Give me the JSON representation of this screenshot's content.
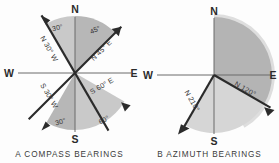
{
  "figures": [
    {
      "id": "compass-bearings",
      "caption": "A   COMPASS BEARINGS",
      "caption_letter": "A",
      "caption_text": "COMPASS BEARINGS",
      "cardinals": {
        "north": "N",
        "south": "S",
        "east": "E",
        "west": "W"
      },
      "center": {
        "x": 75,
        "y": 73
      },
      "radius": 57,
      "bearings": [
        {
          "name": "n30w",
          "label": "N 30° W",
          "angle_label": "30°",
          "quadrant": "NW",
          "from": "N",
          "degrees": 30,
          "toward": "W",
          "azimuth": 330
        },
        {
          "name": "n45e",
          "label": "N 45° E",
          "angle_label": "45°",
          "quadrant": "NE",
          "from": "N",
          "degrees": 45,
          "toward": "E",
          "azimuth": 45
        },
        {
          "name": "s60e",
          "label": "S 60° E",
          "angle_label": "60°",
          "quadrant": "SE",
          "from": "S",
          "degrees": 60,
          "toward": "E",
          "azimuth": 120
        },
        {
          "name": "s30w",
          "label": "S 30° W",
          "angle_label": "30°",
          "quadrant": "SW",
          "from": "S",
          "degrees": 30,
          "toward": "W",
          "azimuth": 210
        }
      ],
      "shaded_sectors": [
        {
          "name": "nw-sector",
          "from_azimuth": 330,
          "to_azimuth": 360,
          "tone": "#c9c9c9"
        },
        {
          "name": "ne-sector",
          "from_azimuth": 0,
          "to_azimuth": 45,
          "tone": "#b9b9b9"
        },
        {
          "name": "se-sector",
          "from_azimuth": 120,
          "to_azimuth": 180,
          "tone": "#c9c9c9"
        },
        {
          "name": "sw-sector",
          "from_azimuth": 180,
          "to_azimuth": 210,
          "tone": "#b9b9b9"
        }
      ]
    },
    {
      "id": "azimuth-bearings",
      "caption": "B   AZIMUTH BEARINGS",
      "caption_letter": "B",
      "caption_text": "AZIMUTH BEARINGS",
      "cardinals": {
        "north": "N",
        "south": "S",
        "east": "E",
        "west": "W"
      },
      "center": {
        "x": 74,
        "y": 75
      },
      "radius": 58,
      "bearings": [
        {
          "name": "n120",
          "label": "N 120°",
          "degrees": 120,
          "azimuth": 120
        },
        {
          "name": "n210",
          "label": "N 210°",
          "degrees": 210,
          "azimuth": 210
        }
      ],
      "shaded_sectors": [
        {
          "name": "azimuth-120-sector",
          "from_azimuth": 0,
          "to_azimuth": 120,
          "tone": "#b9b9b9"
        },
        {
          "name": "azimuth-210-sector",
          "from_azimuth": 120,
          "to_azimuth": 210,
          "tone": "#d6d6d6"
        }
      ]
    }
  ],
  "colors": {
    "ink": "#2b2b2b",
    "rule": "#555555",
    "shade_dark": "#b9b9b9",
    "shade_light": "#d6d6d6",
    "shade_mid": "#c9c9c9",
    "background": "#fdfdfd"
  }
}
